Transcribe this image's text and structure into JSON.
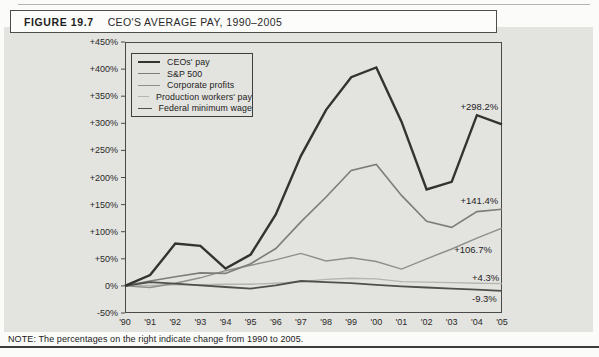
{
  "figure": {
    "label": "FIGURE 19.7",
    "title": "CEO'S AVERAGE PAY, 1990–2005"
  },
  "note": "NOTE: The percentages on the right indicate change from 1990 to 2005.",
  "colors": {
    "panel_bg": "#e3e3df",
    "plot_border": "#4a4a48",
    "tick_text": "#2a2a2a"
  },
  "chart_data": {
    "type": "line",
    "xlabel": "",
    "ylabel": "",
    "x_labels": [
      "'90",
      "'91",
      "'92",
      "'93",
      "'94",
      "'95",
      "'96",
      "'97",
      "'98",
      "'99",
      "'00",
      "'01",
      "'02",
      "'03",
      "'04",
      "'05"
    ],
    "ylim": [
      -50,
      450
    ],
    "grid": false,
    "legend_position": "top-left",
    "y_axis": {
      "tick_labels": [
        "+450%",
        "+400%",
        "+350%",
        "+300%",
        "+250%",
        "+200%",
        "+150%",
        "+100%",
        "+50%",
        "0%",
        "-50%"
      ],
      "tick_values": [
        450,
        400,
        350,
        300,
        250,
        200,
        150,
        100,
        50,
        0,
        -50
      ]
    },
    "series": [
      {
        "name": "Production workers' pay",
        "color": "#b4b4b0",
        "stroke_width": 1.4,
        "values": [
          0,
          1,
          2,
          2,
          3,
          3,
          5,
          8,
          12,
          14,
          13,
          8,
          7,
          6,
          5,
          4.3
        ],
        "end_change": "+4.3%"
      },
      {
        "name": "Corporate profits",
        "color": "#8e8e8b",
        "stroke_width": 1.4,
        "values": [
          0,
          -3,
          5,
          15,
          28,
          38,
          48,
          60,
          46,
          52,
          45,
          31,
          50,
          68,
          88,
          106.7
        ],
        "end_change": "+106.7%"
      },
      {
        "name": "S&P 500",
        "color": "#7d7d7a",
        "stroke_width": 1.6,
        "values": [
          0,
          9,
          17,
          24,
          23,
          41,
          69,
          118,
          164,
          213,
          224,
          167,
          119,
          108,
          137,
          141.4
        ],
        "end_change": "+141.4%"
      },
      {
        "name": "Federal minimum wage",
        "color": "#4f4f4d",
        "stroke_width": 1.8,
        "values": [
          0,
          7,
          4,
          1,
          -2,
          -5,
          1,
          9,
          7,
          5,
          2,
          -1,
          -3,
          -5,
          -7,
          -9.3
        ],
        "end_change": "-9.3%"
      },
      {
        "name": "CEOs' pay",
        "color": "#333331",
        "stroke_width": 2.4,
        "values": [
          0,
          20,
          78,
          74,
          32,
          58,
          132,
          240,
          325,
          385,
          403,
          303,
          178,
          192,
          315,
          298.2
        ],
        "end_change": "+298.2%"
      }
    ],
    "legend_order": [
      "CEOs' pay",
      "S&P 500",
      "Corporate profits",
      "Production workers' pay",
      "Federal minimum wage"
    ],
    "annotations": [
      {
        "label": "+298.2%",
        "year_index": 14.1,
        "value": 330
      },
      {
        "label": "+141.4%",
        "year_index": 14.1,
        "value": 156
      },
      {
        "label": "+106.7%",
        "year_index": 13.85,
        "value": 67
      },
      {
        "label": "+4.3%",
        "year_index": 14.35,
        "value": 14
      },
      {
        "label": "-9.3%",
        "year_index": 14.3,
        "value": -25
      }
    ]
  }
}
